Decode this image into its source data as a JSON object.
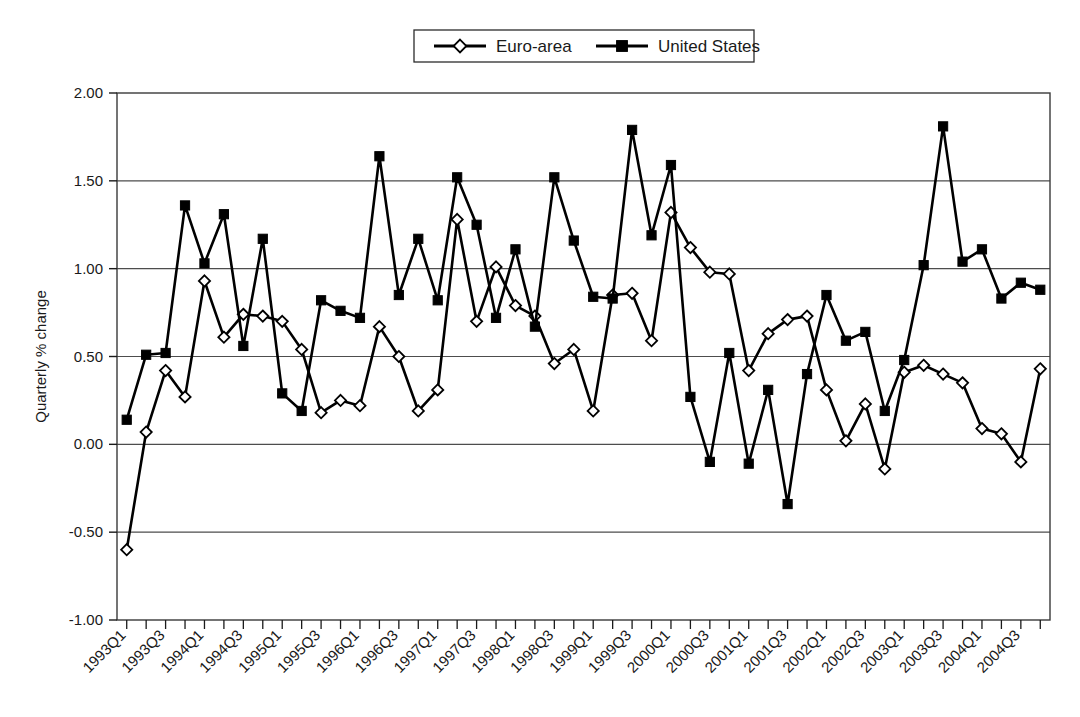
{
  "chart_data": {
    "type": "line",
    "title": "",
    "xlabel": "",
    "ylabel": "Quarterly % change",
    "ylim": [
      -1.0,
      2.0
    ],
    "ytick_step": 0.5,
    "ytick_labels": [
      "2.00",
      "1.50",
      "1.00",
      "0.50",
      "0.00",
      "-0.50",
      "-1.00"
    ],
    "ytick_values": [
      2.0,
      1.5,
      1.0,
      0.5,
      0.0,
      -0.5,
      -1.0
    ],
    "grid": true,
    "grid_axis": "y",
    "legend_position": "top-center",
    "xtick_label_every": 2,
    "xtick_label_rotation": -45,
    "categories": [
      "1993Q1",
      "1993Q2",
      "1993Q3",
      "1993Q4",
      "1994Q1",
      "1994Q2",
      "1994Q3",
      "1994Q4",
      "1995Q1",
      "1995Q2",
      "1995Q3",
      "1995Q4",
      "1996Q1",
      "1996Q2",
      "1996Q3",
      "1996Q4",
      "1997Q1",
      "1997Q2",
      "1997Q3",
      "1997Q4",
      "1998Q1",
      "1998Q2",
      "1998Q3",
      "1998Q4",
      "1999Q1",
      "1999Q2",
      "1999Q3",
      "1999Q4",
      "2000Q1",
      "2000Q2",
      "2000Q3",
      "2000Q4",
      "2001Q1",
      "2001Q2",
      "2001Q3",
      "2001Q4",
      "2002Q1",
      "2002Q2",
      "2002Q3",
      "2002Q4",
      "2003Q1",
      "2003Q2",
      "2003Q3",
      "2003Q4",
      "2004Q1",
      "2004Q2",
      "2004Q3",
      "2004Q4"
    ],
    "xtick_labels_shown": [
      "1993Q1",
      "1993Q3",
      "1994Q1",
      "1994Q3",
      "1995Q1",
      "1995Q3",
      "1996Q1",
      "1996Q3",
      "1997Q1",
      "1997Q3",
      "1998Q1",
      "1998Q3",
      "1999Q1",
      "1999Q3",
      "2000Q1",
      "2000Q3",
      "2001Q1",
      "2001Q3",
      "2002Q1",
      "2002Q3",
      "2003Q1",
      "2003Q3",
      "2004Q1",
      "2004Q3"
    ],
    "series": [
      {
        "name": "Euro-area",
        "marker": "open-diamond",
        "color": "#000000",
        "values": [
          -0.6,
          0.07,
          0.42,
          0.27,
          0.93,
          0.61,
          0.74,
          0.73,
          0.7,
          0.54,
          0.18,
          0.25,
          0.22,
          0.67,
          0.5,
          0.19,
          0.31,
          1.28,
          0.7,
          1.01,
          0.79,
          0.73,
          0.46,
          0.54,
          0.19,
          0.85,
          0.86,
          0.59,
          1.32,
          1.12,
          0.98,
          0.97,
          0.42,
          0.63,
          0.71,
          0.73,
          0.31,
          0.02,
          0.23,
          -0.14,
          0.41,
          0.45,
          0.4,
          0.35,
          0.09,
          0.06,
          -0.1,
          0.43
        ]
      },
      {
        "name": "United States",
        "marker": "filled-square",
        "color": "#000000",
        "values": [
          0.14,
          0.51,
          0.52,
          1.36,
          1.03,
          1.31,
          0.56,
          1.17,
          0.29,
          0.19,
          0.82,
          0.76,
          0.72,
          1.64,
          0.85,
          1.17,
          0.82,
          1.52,
          1.25,
          0.72,
          1.11,
          0.67,
          1.52,
          1.16,
          0.84,
          0.83,
          1.79,
          1.19,
          1.59,
          0.27,
          -0.1,
          0.52,
          -0.11,
          0.31,
          -0.34,
          0.4,
          0.85,
          0.59,
          0.64,
          0.19,
          0.48,
          1.02,
          1.81,
          1.04,
          1.11,
          0.83,
          0.92,
          0.88
        ]
      }
    ]
  },
  "legend": {
    "items": [
      {
        "label": "Euro-area",
        "marker": "open-diamond"
      },
      {
        "label": "United States",
        "marker": "filled-square"
      }
    ]
  },
  "axes": {
    "y_axis_title": "Quarterly % change"
  }
}
